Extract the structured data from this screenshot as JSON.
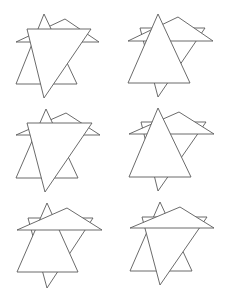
{
  "diagram": {
    "colors": {
      "background": "#ffffff",
      "stroke": "#5a5a5a",
      "fill": "#ffffff"
    },
    "figures": [
      {
        "id": "figure-1",
        "layers_back_to_front": [
          {
            "name": "flat-triangle",
            "points": [
              [
                16,
                42
              ],
              [
                65,
                19
              ],
              [
                99,
                42
              ]
            ]
          },
          {
            "name": "upward-triangle",
            "points": [
              [
                16,
                84
              ],
              [
                44,
                14
              ],
              [
                77,
                84
              ]
            ]
          },
          {
            "name": "downward-triangle",
            "points": [
              [
                27,
                29
              ],
              [
                91,
                29
              ],
              [
                44,
                98
              ]
            ]
          }
        ]
      },
      {
        "id": "figure-2",
        "layers_back_to_front": [
          {
            "name": "downward-triangle",
            "points": [
              [
                140,
                28
              ],
              [
                205,
                28
              ],
              [
                158,
                97
              ]
            ]
          },
          {
            "name": "flat-triangle",
            "points": [
              [
                128,
                41
              ],
              [
                178,
                17
              ],
              [
                213,
                41
              ]
            ]
          },
          {
            "name": "upward-triangle",
            "points": [
              [
                128,
                83
              ],
              [
                158,
                14
              ],
              [
                190,
                83
              ]
            ]
          }
        ]
      },
      {
        "id": "figure-3",
        "layers_back_to_front": [
          {
            "name": "flat-triangle",
            "points": [
              [
                16,
                135
              ],
              [
                66,
                113
              ],
              [
                100,
                135
              ]
            ]
          },
          {
            "name": "upward-triangle",
            "points": [
              [
                16,
                178
              ],
              [
                46,
                109
              ],
              [
                78,
                178
              ]
            ]
          },
          {
            "name": "downward-triangle",
            "points": [
              [
                27,
                123
              ],
              [
                92,
                123
              ],
              [
                45,
                192
              ]
            ]
          }
        ]
      },
      {
        "id": "figure-4",
        "layers_back_to_front": [
          {
            "name": "downward-triangle",
            "points": [
              [
                141,
                122
              ],
              [
                206,
                122
              ],
              [
                158,
                191
              ]
            ]
          },
          {
            "name": "flat-triangle",
            "points": [
              [
                129,
                134
              ],
              [
                179,
                112
              ],
              [
                214,
                134
              ]
            ]
          },
          {
            "name": "upward-triangle",
            "points": [
              [
                129,
                177
              ],
              [
                158,
                108
              ],
              [
                191,
                177
              ]
            ]
          }
        ]
      },
      {
        "id": "figure-5",
        "layers_back_to_front": [
          {
            "name": "downward-triangle",
            "points": [
              [
                28,
                218
              ],
              [
                93,
                218
              ],
              [
                47,
                288
              ]
            ]
          },
          {
            "name": "upward-triangle",
            "points": [
              [
                17,
                272
              ],
              [
                47,
                203
              ],
              [
                78,
                272
              ]
            ]
          },
          {
            "name": "flat-triangle",
            "points": [
              [
                17,
                230
              ],
              [
                67,
                208
              ],
              [
                102,
                230
              ]
            ]
          }
        ]
      },
      {
        "id": "figure-6",
        "layers_back_to_front": [
          {
            "name": "upward-triangle",
            "points": [
              [
                130,
                271
              ],
              [
                160,
                202
              ],
              [
                192,
                271
              ]
            ]
          },
          {
            "name": "downward-triangle",
            "points": [
              [
                142,
                217
              ],
              [
                207,
                217
              ],
              [
                160,
                285
              ]
            ]
          },
          {
            "name": "flat-triangle",
            "points": [
              [
                130,
                228
              ],
              [
                180,
                207
              ],
              [
                214,
                228
              ]
            ]
          }
        ]
      }
    ]
  }
}
